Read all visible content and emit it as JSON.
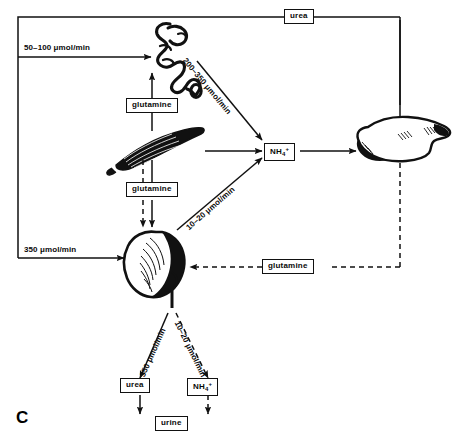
{
  "figure": {
    "panel_letter": "C",
    "type": "physiological-flow-diagram"
  },
  "organs": [
    {
      "id": "gut",
      "name": "intestine"
    },
    {
      "id": "muscle",
      "name": "skeletal-muscle"
    },
    {
      "id": "kidney",
      "name": "kidney"
    },
    {
      "id": "liver",
      "name": "liver"
    }
  ],
  "boxes": {
    "urea_top": "urea",
    "glutamine_gut": "glutamine",
    "ammonium_mid": "NH",
    "ammonium_mid_sub": "4",
    "ammonium_mid_sup": "+",
    "glutamine_kidney": "glutamine",
    "glutamine_liver": "glutamine",
    "urea_urine": "urea",
    "ammonium_urine": "NH",
    "ammonium_urine_sub": "4",
    "ammonium_urine_sup": "+",
    "urine": "urine"
  },
  "flux_labels": {
    "gut_input": "50–100 μmol/min",
    "gut_to_ammonium": "200–350 μmol/min",
    "kidney_input": "350 μmol/min",
    "kidney_to_ammonium": "10–20 μmol/min",
    "kidney_to_urea": "350 μmol/min",
    "kidney_to_nh4": "10–20 μmol/min"
  },
  "colors": {
    "ink": "#111111",
    "paper": "#ffffff"
  }
}
